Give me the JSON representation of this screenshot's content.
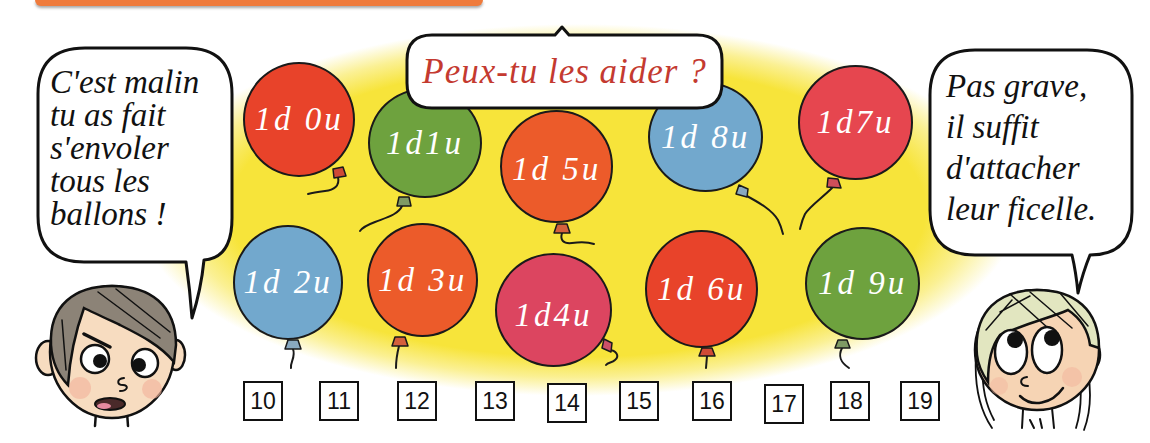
{
  "banner": {
    "color": "#ef7b3c"
  },
  "bubbles": {
    "left": {
      "lines": [
        "C'est malin",
        "tu as fait",
        "s'envoler",
        "tous les",
        "ballons !"
      ]
    },
    "center": {
      "text": "Peux-tu les aider ?",
      "color": "#c43a30"
    },
    "right": {
      "lines": [
        "Pas grave,",
        "il suffit",
        "d'attacher",
        "leur ficelle."
      ]
    }
  },
  "balloons": [
    {
      "label": "1d 0u",
      "color": "#e8432a",
      "knot_color": "#cf4a36"
    },
    {
      "label": "1d1u",
      "color": "#6ea23e",
      "knot_color": "#7f9a64"
    },
    {
      "label": "1d 5u",
      "color": "#ec5b2a",
      "knot_color": "#d4603c"
    },
    {
      "label": "1d 8u",
      "color": "#72a8cd",
      "knot_color": "#89a9c0"
    },
    {
      "label": "1d7u",
      "color": "#e6464f",
      "knot_color": "#cf4f5a"
    },
    {
      "label": "1d 2u",
      "color": "#72a8cd",
      "knot_color": "#89a9c0"
    },
    {
      "label": "1d 3u",
      "color": "#ec5b2a",
      "knot_color": "#d4603c"
    },
    {
      "label": "1d4u",
      "color": "#dc4560",
      "knot_color": "#cc5068"
    },
    {
      "label": "1d 6u",
      "color": "#e8432a",
      "knot_color": "#cf4a36"
    },
    {
      "label": "1d 9u",
      "color": "#6ea23e",
      "knot_color": "#7f9a64"
    }
  ],
  "number_boxes": [
    "10",
    "11",
    "12",
    "13",
    "14",
    "15",
    "16",
    "17",
    "18",
    "19"
  ],
  "characters": {
    "boy": {
      "hair_color": "#8c8377",
      "skin_color": "#f7dcc0",
      "cheek_color": "#f2b49c"
    },
    "girl": {
      "hair_color": "#e2e6c0",
      "skin_color": "#f6d4b4",
      "cheek_color": "#f2b49c"
    }
  }
}
